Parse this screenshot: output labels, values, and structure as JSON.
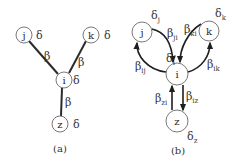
{
  "figure_a": {
    "caption": "(a)",
    "nodes": [
      {
        "id": "j",
        "label": "j",
        "param": "δ"
      },
      {
        "id": "k",
        "label": "k",
        "param": "δ"
      },
      {
        "id": "i",
        "label": "i",
        "param": "δ"
      },
      {
        "id": "z",
        "label": "z",
        "param": "δ"
      }
    ],
    "edges": [
      {
        "from": "j",
        "to": "i",
        "label": "β"
      },
      {
        "from": "k",
        "to": "i",
        "label": "β"
      },
      {
        "from": "i",
        "to": "z",
        "label": "β"
      }
    ]
  },
  "figure_b": {
    "caption": "(b)",
    "nodes": [
      {
        "id": "j",
        "label": "j",
        "param": "δ",
        "param_sub": "j"
      },
      {
        "id": "k",
        "label": "k",
        "param": "δ",
        "param_sub": "k"
      },
      {
        "id": "i",
        "label": "i",
        "param": "δ",
        "param_sub": "i"
      },
      {
        "id": "z",
        "label": "z",
        "param": "δ",
        "param_sub": "z"
      }
    ],
    "edges": [
      {
        "from": "j",
        "to": "i",
        "label": "β",
        "sub": "ji"
      },
      {
        "from": "i",
        "to": "j",
        "label": "β",
        "sub": "ij"
      },
      {
        "from": "k",
        "to": "i",
        "label": "β",
        "sub": "ki"
      },
      {
        "from": "i",
        "to": "k",
        "label": "β",
        "sub": "ik"
      },
      {
        "from": "z",
        "to": "i",
        "label": "β",
        "sub": "zi"
      },
      {
        "from": "i",
        "to": "z",
        "label": "β",
        "sub": "iz"
      }
    ]
  }
}
